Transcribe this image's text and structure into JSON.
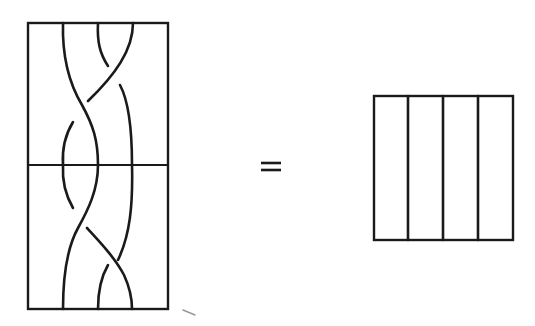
{
  "figure": {
    "left_diagram": {
      "name": "braid-product",
      "strand_count": 3,
      "panels": [
        {
          "name": "top-braid",
          "crossings": 2
        },
        {
          "name": "bottom-braid",
          "crossings": 2
        }
      ]
    },
    "operator": {
      "symbol": "="
    },
    "right_diagram": {
      "name": "identity-braid",
      "strand_count": 3,
      "crossings": 0
    }
  }
}
